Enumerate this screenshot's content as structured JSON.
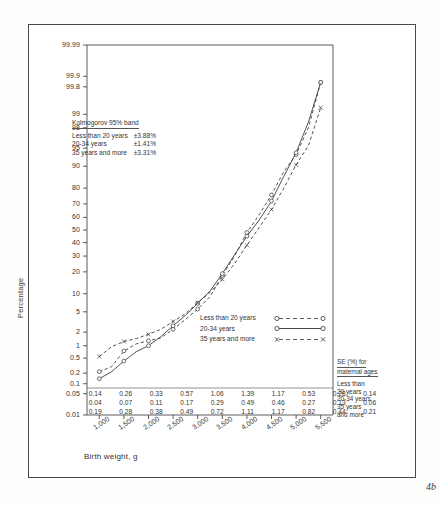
{
  "figure": {
    "number": "4b",
    "ylabel": "Percentage",
    "xlabel": "Birth weight, g"
  },
  "kolmogorov": {
    "header": "Kolmogorov 95% band",
    "rows": [
      {
        "label": "Less than 20 years",
        "value": "±3.88%"
      },
      {
        "label": "20-34 years",
        "value": "±1.41%"
      },
      {
        "label": "35 years and more",
        "value": "±3.31%"
      }
    ]
  },
  "legend": {
    "items": [
      {
        "label": "Less than 20 years",
        "marker": "circle",
        "style": "dashed"
      },
      {
        "label": "20-34 years",
        "marker": "circle",
        "style": "solid"
      },
      {
        "label": "35 years and more",
        "marker": "cross",
        "style": "dashed"
      }
    ]
  },
  "se_block": {
    "header_line1": "SE (%) for",
    "header_line2": "maternal ages",
    "rows": [
      "Less than",
      "20 years",
      "20-34 years",
      "35 years",
      "and more"
    ]
  },
  "se_table": {
    "row_labels": [
      "Less than 20 years",
      "20-34 years",
      "35 years and more"
    ],
    "rows": [
      [
        "0.14",
        "0.26",
        "0.33",
        "0.57",
        "1.06",
        "1.39",
        "1.17",
        "0.53",
        "0.28",
        "0.14"
      ],
      [
        "0.04",
        "0.07",
        "0.11",
        "0.17",
        "0.29",
        "0.49",
        "0.46",
        "0.27",
        "0.13",
        "0.06"
      ],
      [
        "0.19",
        "0.28",
        "0.38",
        "0.49",
        "0.72",
        "1.11",
        "1.17",
        "0.82",
        "0.44",
        "0.21"
      ]
    ]
  },
  "chart_data": {
    "type": "line",
    "title": "",
    "xlabel": "Birth weight, g",
    "ylabel": "Percentage",
    "y_scale": "normal-probability (probit)",
    "yticks": [
      "99.99",
      "99.9",
      "99.8",
      "99",
      "98",
      "95",
      "90",
      "80",
      "70",
      "60",
      "50",
      "40",
      "30",
      "20",
      "10",
      "5",
      "2",
      "1",
      "0.5",
      "0.2",
      "0.1",
      "0.05",
      "0.01"
    ],
    "xticks": [
      "1,000",
      "1,500",
      "2,000",
      "2,500",
      "3,000",
      "3,500",
      "4,000",
      "4,500",
      "5,000",
      "5,500"
    ],
    "xlim": [
      750,
      5750
    ],
    "ylim": [
      0.01,
      99.99
    ],
    "grid": false,
    "legend_position": "inside-right",
    "x": [
      1000,
      1250,
      1500,
      1750,
      2000,
      2250,
      2500,
      2750,
      3000,
      3250,
      3500,
      3750,
      4000,
      4250,
      4500,
      4750,
      5000,
      5250,
      5500
    ],
    "series": [
      {
        "name": "Less than 20 years",
        "style": "dashed",
        "marker": "circle",
        "values": [
          0.22,
          0.3,
          0.75,
          1.1,
          1.3,
          1.5,
          2.3,
          3.6,
          5.6,
          9.0,
          18,
          30,
          48,
          62,
          76,
          88,
          93.5,
          98.0,
          99.85
        ]
      },
      {
        "name": "20-34 years",
        "style": "solid",
        "marker": "circle",
        "values": [
          0.14,
          0.22,
          0.42,
          0.72,
          1.0,
          1.6,
          2.7,
          4.3,
          7.0,
          11.0,
          19,
          31,
          45,
          58,
          72,
          86,
          94.0,
          98.5,
          99.85
        ]
      },
      {
        "name": "35 years and more",
        "style": "dashed",
        "marker": "cross",
        "values": [
          0.55,
          0.95,
          1.25,
          1.45,
          1.8,
          2.3,
          3.3,
          4.6,
          7.2,
          10.5,
          16,
          25,
          38,
          52,
          66,
          80,
          90.5,
          95.5,
          99.3
        ]
      }
    ]
  }
}
